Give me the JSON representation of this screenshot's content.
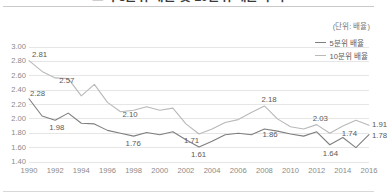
{
  "header": {
    "title": "소득 5분위 배율 및 10분위 배율 추이",
    "unit_caption": "(단위: 배율)"
  },
  "legend": {
    "position": "top-right",
    "items": [
      {
        "label": "5분위 배율",
        "color": "#7f7f7f",
        "icon": "line-swatch-icon"
      },
      {
        "label": "10분위 배율",
        "color": "#b9b9b9",
        "icon": "line-swatch-icon"
      }
    ]
  },
  "axes": {
    "y_ticks": [
      "3.00",
      "2.80",
      "2.60",
      "2.40",
      "2.20",
      "2.00",
      "1.80",
      "1.60",
      "1.40"
    ],
    "x_ticks": [
      "1990",
      "1992",
      "1994",
      "1996",
      "1998",
      "2000",
      "2002",
      "2004",
      "2006",
      "2008",
      "2010",
      "2012",
      "2014",
      "2016"
    ]
  },
  "chart_data": {
    "type": "line",
    "title": "소득 5분위 배율 및 10분위 배율 추이",
    "xlabel": "",
    "ylabel": "배율",
    "ylim": [
      1.4,
      3.0
    ],
    "ytick_step": 0.2,
    "grid": true,
    "legend_position": "top-right",
    "x": [
      1990,
      1991,
      1992,
      1993,
      1994,
      1995,
      1996,
      1997,
      1998,
      1999,
      2000,
      2001,
      2002,
      2003,
      2004,
      2005,
      2006,
      2007,
      2008,
      2009,
      2010,
      2011,
      2012,
      2013,
      2014,
      2015,
      2016
    ],
    "series": [
      {
        "name": "10분위 배율",
        "color": "#b9b9b9",
        "values": [
          2.81,
          2.66,
          2.57,
          2.56,
          2.32,
          2.48,
          2.23,
          2.1,
          2.12,
          2.17,
          2.12,
          2.15,
          1.93,
          1.79,
          1.86,
          1.95,
          1.99,
          2.09,
          2.18,
          2.0,
          1.89,
          1.86,
          1.92,
          1.8,
          1.9,
          1.98,
          1.91
        ],
        "labeled_points": [
          {
            "x": 1990,
            "value": 2.81
          },
          {
            "x": 1992,
            "value": 2.57
          },
          {
            "x": 1997,
            "value": 2.1
          },
          {
            "x": 2008,
            "value": 2.18
          },
          {
            "x": 2012,
            "value": 2.03
          },
          {
            "x": 2016,
            "value": 1.91
          }
        ]
      },
      {
        "name": "5분위 배율",
        "color": "#7f7f7f",
        "values": [
          2.28,
          2.04,
          1.98,
          2.08,
          1.94,
          1.93,
          1.84,
          1.8,
          1.76,
          1.81,
          1.78,
          1.82,
          1.71,
          1.61,
          1.69,
          1.78,
          1.8,
          1.78,
          1.86,
          1.83,
          1.79,
          1.76,
          1.82,
          1.64,
          1.74,
          1.6,
          1.78
        ]
      }
    ],
    "annotations": [
      {
        "text": "2.81",
        "series": "10분위 배율",
        "x": 1990
      },
      {
        "text": "2.57",
        "series": "10분위 배율",
        "x": 1992
      },
      {
        "text": "2.10",
        "series": "10분위 배율",
        "x": 1997
      },
      {
        "text": "2.18",
        "series": "10분위 배율",
        "x": 2008
      },
      {
        "text": "2.03",
        "series": "10분위 배율",
        "x": 2012
      },
      {
        "text": "1.91",
        "series": "10분위 배율",
        "x": 2016
      },
      {
        "text": "2.28",
        "series": "5분위 배율",
        "x": 1990
      },
      {
        "text": "1.98",
        "series": "5분위 배율",
        "x": 1992
      },
      {
        "text": "1.76",
        "series": "5분위 배율",
        "x": 1998
      },
      {
        "text": "1.61",
        "series": "5분위 배율",
        "x": 2003
      },
      {
        "text": "1.71",
        "series": "5분위 배율",
        "x": 2002
      },
      {
        "text": "1.86",
        "series": "5분위 배율",
        "x": 2008
      },
      {
        "text": "1.64",
        "series": "5분위 배율",
        "x": 2013
      },
      {
        "text": "1.74",
        "series": "5분위 배율",
        "x": 2014
      },
      {
        "text": "1.78",
        "series": "5분위 배율",
        "x": 2016
      }
    ]
  }
}
